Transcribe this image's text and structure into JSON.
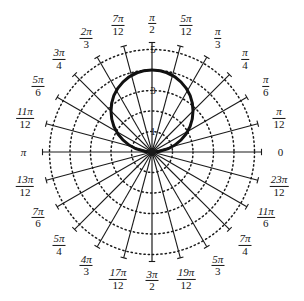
{
  "chart_data": {
    "type": "line",
    "title": "",
    "subtitle": "",
    "plot_kind": "polar-grid",
    "xlabel": "",
    "ylabel": "",
    "grid": true,
    "grid_style": "dotted",
    "legend": "none",
    "center": {
      "x": 152,
      "y": 152
    },
    "pixels_per_unit": 20.5,
    "radial": {
      "ticks": [
        1,
        2,
        3,
        4,
        5
      ],
      "labeled_ticks": [
        "1",
        "3",
        "5"
      ],
      "rlim": [
        0,
        5
      ],
      "rings": 5
    },
    "angular": {
      "step_label": "pi/12",
      "divisions": 24,
      "labels": [
        {
          "value": "0",
          "angle_deg": 0,
          "num": "",
          "den": "",
          "plain": "0"
        },
        {
          "value": "pi/12",
          "angle_deg": 15,
          "num": "π",
          "den": "12"
        },
        {
          "value": "pi/6",
          "angle_deg": 30,
          "num": "π",
          "den": "6"
        },
        {
          "value": "pi/4",
          "angle_deg": 45,
          "num": "π",
          "den": "4"
        },
        {
          "value": "pi/3",
          "angle_deg": 60,
          "num": "π",
          "den": "3"
        },
        {
          "value": "5pi/12",
          "angle_deg": 75,
          "num": "5π",
          "den": "12"
        },
        {
          "value": "pi/2",
          "angle_deg": 90,
          "num": "π",
          "den": "2"
        },
        {
          "value": "7pi/12",
          "angle_deg": 105,
          "num": "7π",
          "den": "12"
        },
        {
          "value": "2pi/3",
          "angle_deg": 120,
          "num": "2π",
          "den": "3"
        },
        {
          "value": "3pi/4",
          "angle_deg": 135,
          "num": "3π",
          "den": "4"
        },
        {
          "value": "5pi/6",
          "angle_deg": 150,
          "num": "5π",
          "den": "6"
        },
        {
          "value": "11pi/12",
          "angle_deg": 165,
          "num": "11π",
          "den": "12"
        },
        {
          "value": "pi",
          "angle_deg": 180,
          "num": "",
          "den": "",
          "plain": "π"
        },
        {
          "value": "13pi/12",
          "angle_deg": 195,
          "num": "13π",
          "den": "12"
        },
        {
          "value": "7pi/6",
          "angle_deg": 210,
          "num": "7π",
          "den": "6"
        },
        {
          "value": "5pi/4",
          "angle_deg": 225,
          "num": "5π",
          "den": "4"
        },
        {
          "value": "4pi/3",
          "angle_deg": 240,
          "num": "4π",
          "den": "3"
        },
        {
          "value": "17pi/12",
          "angle_deg": 255,
          "num": "17π",
          "den": "12"
        },
        {
          "value": "3pi/2",
          "angle_deg": 270,
          "num": "3π",
          "den": "2"
        },
        {
          "value": "19pi/12",
          "angle_deg": 285,
          "num": "19π",
          "den": "12"
        },
        {
          "value": "5pi/3",
          "angle_deg": 300,
          "num": "5π",
          "den": "3"
        },
        {
          "value": "7pi/4",
          "angle_deg": 315,
          "num": "7π",
          "den": "4"
        },
        {
          "value": "11pi/6",
          "angle_deg": 330,
          "num": "11π",
          "den": "6"
        },
        {
          "value": "23pi/12",
          "angle_deg": 345,
          "num": "23π",
          "den": "12"
        }
      ]
    },
    "series": [
      {
        "name": "r = 4 sin(theta)",
        "shape": "circle-through-origin",
        "max_r": 4,
        "max_r_angle_deg": 90,
        "stroke": "#111111",
        "stroke_width": 3
      }
    ],
    "colors": {
      "background": "#ffffff",
      "grid": "#1a1a1a",
      "spoke": "#1a1a1a",
      "curve": "#111111",
      "text": "#161616"
    }
  }
}
